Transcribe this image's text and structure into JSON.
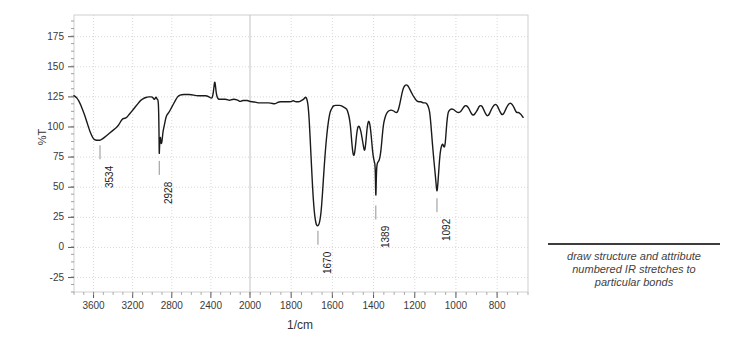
{
  "chart_data": {
    "type": "line",
    "title": "",
    "subtitle": "",
    "xlabel": "1/cm",
    "ylabel": "%T",
    "xlim": [
      3800,
      650
    ],
    "ylim": [
      -37,
      193
    ],
    "x_axis_inverted": true,
    "x_scale_break_at": 2000,
    "grid": true,
    "legend": null,
    "xticks": [
      3600,
      3200,
      2800,
      2400,
      2000,
      1800,
      1600,
      1400,
      1200,
      1000,
      800
    ],
    "yticks": [
      175,
      150,
      125,
      100,
      75,
      50,
      25,
      0,
      -25
    ],
    "annotations": [
      {
        "label": "3534",
        "x": 3534,
        "y": 89
      },
      {
        "label": "2928",
        "x": 2928,
        "y": 76
      },
      {
        "label": "1670",
        "x": 1670,
        "y": 18
      },
      {
        "label": "1389",
        "x": 1389,
        "y": 39
      },
      {
        "label": "1092",
        "x": 1092,
        "y": 45
      }
    ],
    "series": [
      {
        "name": "IR transmittance",
        "color": "#1a1a1a",
        "points": [
          [
            3800,
            126
          ],
          [
            3780,
            125
          ],
          [
            3760,
            123
          ],
          [
            3740,
            120
          ],
          [
            3720,
            116
          ],
          [
            3700,
            112
          ],
          [
            3680,
            107
          ],
          [
            3660,
            102
          ],
          [
            3640,
            97
          ],
          [
            3620,
            93
          ],
          [
            3600,
            90
          ],
          [
            3580,
            89
          ],
          [
            3560,
            89
          ],
          [
            3540,
            89
          ],
          [
            3534,
            89
          ],
          [
            3510,
            90
          ],
          [
            3480,
            92
          ],
          [
            3450,
            94
          ],
          [
            3420,
            96
          ],
          [
            3390,
            98
          ],
          [
            3360,
            100
          ],
          [
            3340,
            102
          ],
          [
            3320,
            105
          ],
          [
            3300,
            107
          ],
          [
            3280,
            107
          ],
          [
            3260,
            108
          ],
          [
            3240,
            110
          ],
          [
            3220,
            112
          ],
          [
            3200,
            114
          ],
          [
            3180,
            116
          ],
          [
            3160,
            118
          ],
          [
            3140,
            120
          ],
          [
            3120,
            122
          ],
          [
            3100,
            123
          ],
          [
            3080,
            124
          ],
          [
            3050,
            125
          ],
          [
            3020,
            125
          ],
          [
            3000,
            125
          ],
          [
            2990,
            124
          ],
          [
            2980,
            123
          ],
          [
            2975,
            123
          ],
          [
            2968,
            124
          ],
          [
            2960,
            125
          ],
          [
            2955,
            124
          ],
          [
            2950,
            123
          ],
          [
            2945,
            123
          ],
          [
            2940,
            122
          ],
          [
            2936,
            118
          ],
          [
            2932,
            105
          ],
          [
            2930,
            90
          ],
          [
            2928,
            76
          ],
          [
            2926,
            82
          ],
          [
            2922,
            88
          ],
          [
            2918,
            92
          ],
          [
            2914,
            90
          ],
          [
            2910,
            87
          ],
          [
            2906,
            86
          ],
          [
            2900,
            88
          ],
          [
            2895,
            92
          ],
          [
            2890,
            96
          ],
          [
            2885,
            98
          ],
          [
            2880,
            100
          ],
          [
            2870,
            104
          ],
          [
            2860,
            108
          ],
          [
            2850,
            110
          ],
          [
            2830,
            112
          ],
          [
            2810,
            115
          ],
          [
            2790,
            118
          ],
          [
            2770,
            121
          ],
          [
            2750,
            124
          ],
          [
            2730,
            126
          ],
          [
            2700,
            127
          ],
          [
            2650,
            127
          ],
          [
            2600,
            127
          ],
          [
            2550,
            126
          ],
          [
            2500,
            126
          ],
          [
            2470,
            126
          ],
          [
            2440,
            126
          ],
          [
            2420,
            125
          ],
          [
            2400,
            124
          ],
          [
            2390,
            124
          ],
          [
            2380,
            126
          ],
          [
            2370,
            132
          ],
          [
            2362,
            138
          ],
          [
            2355,
            136
          ],
          [
            2348,
            130
          ],
          [
            2340,
            126
          ],
          [
            2330,
            124
          ],
          [
            2320,
            123
          ],
          [
            2300,
            123
          ],
          [
            2270,
            123
          ],
          [
            2240,
            123
          ],
          [
            2210,
            122
          ],
          [
            2180,
            123
          ],
          [
            2150,
            123
          ],
          [
            2120,
            122
          ],
          [
            2100,
            121
          ],
          [
            2080,
            122
          ],
          [
            2060,
            122
          ],
          [
            2040,
            122
          ],
          [
            2020,
            122
          ],
          [
            2000,
            121
          ],
          [
            1980,
            121
          ],
          [
            1960,
            120
          ],
          [
            1940,
            120
          ],
          [
            1920,
            120
          ],
          [
            1900,
            120
          ],
          [
            1880,
            119
          ],
          [
            1870,
            120
          ],
          [
            1860,
            121
          ],
          [
            1840,
            121
          ],
          [
            1820,
            121
          ],
          [
            1800,
            121
          ],
          [
            1790,
            122
          ],
          [
            1780,
            121
          ],
          [
            1770,
            121
          ],
          [
            1760,
            121
          ],
          [
            1750,
            122
          ],
          [
            1740,
            123
          ],
          [
            1735,
            124
          ],
          [
            1730,
            125
          ],
          [
            1726,
            124
          ],
          [
            1722,
            122
          ],
          [
            1718,
            118
          ],
          [
            1714,
            110
          ],
          [
            1710,
            98
          ],
          [
            1706,
            84
          ],
          [
            1702,
            70
          ],
          [
            1698,
            56
          ],
          [
            1694,
            44
          ],
          [
            1690,
            34
          ],
          [
            1686,
            27
          ],
          [
            1682,
            22
          ],
          [
            1678,
            19
          ],
          [
            1674,
            18
          ],
          [
            1670,
            18
          ],
          [
            1666,
            19
          ],
          [
            1662,
            21
          ],
          [
            1658,
            25
          ],
          [
            1654,
            31
          ],
          [
            1650,
            40
          ],
          [
            1646,
            50
          ],
          [
            1642,
            61
          ],
          [
            1638,
            71
          ],
          [
            1634,
            80
          ],
          [
            1630,
            88
          ],
          [
            1626,
            95
          ],
          [
            1622,
            101
          ],
          [
            1618,
            106
          ],
          [
            1614,
            110
          ],
          [
            1610,
            113
          ],
          [
            1604,
            115
          ],
          [
            1598,
            117
          ],
          [
            1590,
            118
          ],
          [
            1580,
            118
          ],
          [
            1570,
            118
          ],
          [
            1560,
            118
          ],
          [
            1550,
            117
          ],
          [
            1540,
            116
          ],
          [
            1530,
            115
          ],
          [
            1524,
            112
          ],
          [
            1518,
            108
          ],
          [
            1512,
            101
          ],
          [
            1508,
            92
          ],
          [
            1504,
            84
          ],
          [
            1500,
            78
          ],
          [
            1496,
            76
          ],
          [
            1492,
            78
          ],
          [
            1488,
            84
          ],
          [
            1484,
            91
          ],
          [
            1480,
            97
          ],
          [
            1476,
            100
          ],
          [
            1472,
            101
          ],
          [
            1468,
            100
          ],
          [
            1464,
            98
          ],
          [
            1460,
            95
          ],
          [
            1456,
            91
          ],
          [
            1452,
            87
          ],
          [
            1448,
            83
          ],
          [
            1444,
            80
          ],
          [
            1440,
            83
          ],
          [
            1436,
            90
          ],
          [
            1432,
            98
          ],
          [
            1428,
            103
          ],
          [
            1424,
            105
          ],
          [
            1420,
            104
          ],
          [
            1416,
            100
          ],
          [
            1412,
            94
          ],
          [
            1408,
            86
          ],
          [
            1404,
            79
          ],
          [
            1400,
            74
          ],
          [
            1396,
            71
          ],
          [
            1393,
            69
          ],
          [
            1391,
            60
          ],
          [
            1389,
            39
          ],
          [
            1387,
            55
          ],
          [
            1385,
            66
          ],
          [
            1382,
            70
          ],
          [
            1378,
            71
          ],
          [
            1374,
            72
          ],
          [
            1370,
            74
          ],
          [
            1366,
            78
          ],
          [
            1362,
            84
          ],
          [
            1358,
            92
          ],
          [
            1354,
            99
          ],
          [
            1350,
            104
          ],
          [
            1344,
            108
          ],
          [
            1338,
            111
          ],
          [
            1330,
            113
          ],
          [
            1320,
            114
          ],
          [
            1310,
            114
          ],
          [
            1300,
            113
          ],
          [
            1292,
            112
          ],
          [
            1286,
            112
          ],
          [
            1280,
            114
          ],
          [
            1274,
            118
          ],
          [
            1268,
            123
          ],
          [
            1262,
            128
          ],
          [
            1256,
            132
          ],
          [
            1250,
            134
          ],
          [
            1244,
            135
          ],
          [
            1238,
            135
          ],
          [
            1232,
            134
          ],
          [
            1226,
            132
          ],
          [
            1220,
            130
          ],
          [
            1214,
            128
          ],
          [
            1208,
            126
          ],
          [
            1200,
            124
          ],
          [
            1192,
            122
          ],
          [
            1184,
            121
          ],
          [
            1176,
            121
          ],
          [
            1168,
            121
          ],
          [
            1160,
            120
          ],
          [
            1152,
            120
          ],
          [
            1146,
            120
          ],
          [
            1140,
            119
          ],
          [
            1134,
            117
          ],
          [
            1128,
            113
          ],
          [
            1124,
            107
          ],
          [
            1120,
            99
          ],
          [
            1116,
            90
          ],
          [
            1112,
            82
          ],
          [
            1108,
            74
          ],
          [
            1104,
            67
          ],
          [
            1100,
            60
          ],
          [
            1096,
            52
          ],
          [
            1092,
            45
          ],
          [
            1088,
            52
          ],
          [
            1084,
            62
          ],
          [
            1080,
            72
          ],
          [
            1076,
            79
          ],
          [
            1072,
            83
          ],
          [
            1068,
            85
          ],
          [
            1064,
            86
          ],
          [
            1060,
            84
          ],
          [
            1056,
            83
          ],
          [
            1052,
            86
          ],
          [
            1048,
            95
          ],
          [
            1044,
            104
          ],
          [
            1040,
            110
          ],
          [
            1036,
            113
          ],
          [
            1030,
            114
          ],
          [
            1024,
            115
          ],
          [
            1016,
            115
          ],
          [
            1008,
            114
          ],
          [
            1000,
            113
          ],
          [
            992,
            112
          ],
          [
            984,
            112
          ],
          [
            976,
            113
          ],
          [
            968,
            115
          ],
          [
            960,
            117
          ],
          [
            952,
            118
          ],
          [
            944,
            117
          ],
          [
            936,
            115
          ],
          [
            928,
            112
          ],
          [
            920,
            110
          ],
          [
            912,
            110
          ],
          [
            904,
            112
          ],
          [
            896,
            114
          ],
          [
            888,
            117
          ],
          [
            880,
            118
          ],
          [
            872,
            117
          ],
          [
            864,
            114
          ],
          [
            856,
            111
          ],
          [
            848,
            109
          ],
          [
            840,
            110
          ],
          [
            832,
            113
          ],
          [
            824,
            116
          ],
          [
            816,
            118
          ],
          [
            808,
            119
          ],
          [
            800,
            118
          ],
          [
            792,
            115
          ],
          [
            784,
            112
          ],
          [
            776,
            110
          ],
          [
            768,
            111
          ],
          [
            760,
            114
          ],
          [
            752,
            117
          ],
          [
            744,
            119
          ],
          [
            736,
            120
          ],
          [
            728,
            119
          ],
          [
            720,
            117
          ],
          [
            712,
            114
          ],
          [
            706,
            112
          ],
          [
            700,
            112
          ],
          [
            694,
            112
          ],
          [
            688,
            111
          ],
          [
            682,
            110
          ],
          [
            678,
            109
          ],
          [
            674,
            108
          ]
        ]
      }
    ]
  },
  "note": {
    "line1": "draw structure and attribute",
    "line2": "numbered IR stretches to",
    "line3": "particular bonds"
  }
}
